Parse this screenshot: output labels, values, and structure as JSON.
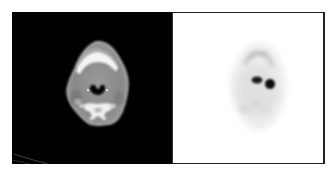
{
  "figure": {
    "panels": [
      {
        "id": "ct",
        "modality": "CT",
        "label": "CT axial slice",
        "background": "#000000",
        "structures": [
          "soft-tissue",
          "mandible",
          "airway",
          "vertebra"
        ]
      },
      {
        "id": "pet",
        "modality": "PET",
        "label": "PET axial slice",
        "background": "#ffffff",
        "hotspots": 2
      }
    ],
    "colors": {
      "ct_background": "#000000",
      "ct_soft_tissue": "#8a8a8a",
      "ct_bone": "#f2f2f2",
      "ct_airway": "#050505",
      "pet_background": "#ffffff",
      "pet_tissue": "#e6e6e6",
      "pet_hotspot": "#0a0a0a",
      "border": "#222222"
    }
  }
}
